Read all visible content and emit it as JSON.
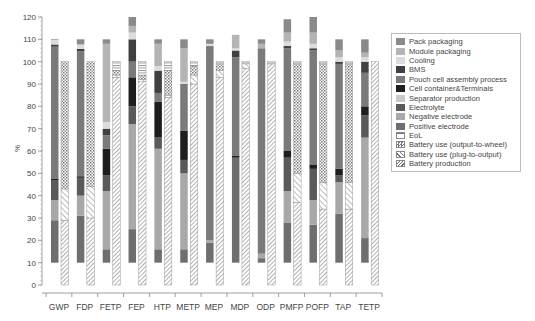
{
  "chart_data": {
    "type": "bar",
    "subtype": "stacked, two bars per category (component contribution bar + life-cycle stage bar)",
    "title": "",
    "xlabel": "",
    "ylabel": "%",
    "ylim": [
      0,
      120
    ],
    "yticks": [
      0,
      10,
      20,
      30,
      40,
      50,
      60,
      70,
      80,
      90,
      100,
      110,
      120
    ],
    "grid": false,
    "legend_position": "right",
    "categories": [
      "GWP",
      "FDP",
      "FETP",
      "FEP",
      "HTP",
      "METP",
      "MEP",
      "MDP",
      "ODP",
      "PMFP",
      "POFP",
      "TAP",
      "TETP"
    ],
    "component_bar_base": 10,
    "component_series": [
      {
        "name": "Positive electrode",
        "color": "#6e6e6e",
        "values": [
          19,
          21,
          6,
          15,
          6,
          6,
          9,
          47,
          2,
          18,
          17,
          22,
          11
        ]
      },
      {
        "name": "Negative electrode",
        "color": "#a8a8a8",
        "values": [
          9,
          9,
          26,
          47,
          45,
          34,
          1,
          0,
          2,
          14,
          11,
          14,
          45
        ]
      },
      {
        "name": "Electrolyte",
        "color": "#5a5a5a",
        "values": [
          9,
          8,
          7,
          8,
          5,
          6,
          0,
          0,
          0,
          15,
          14,
          3,
          10
        ]
      },
      {
        "name": "Separator production",
        "color": "#c8c8c8",
        "values": [
          0,
          0,
          0,
          0,
          0,
          0,
          0,
          0,
          0,
          0,
          0,
          0,
          0
        ]
      },
      {
        "name": "Cell container&Terminals",
        "color": "#1e1e1e",
        "values": [
          0.7,
          0.7,
          12,
          13,
          16,
          13,
          0,
          1,
          0,
          3,
          2,
          3,
          4
        ]
      },
      {
        "name": "Pouch cell assembly process",
        "color": "#7a7a7a",
        "values": [
          59,
          56,
          6,
          7,
          4,
          21,
          87,
          44,
          92,
          46,
          51,
          47,
          15
        ]
      },
      {
        "name": "BMS",
        "color": "#404040",
        "values": [
          1,
          1,
          3,
          10,
          10,
          0,
          0,
          3,
          0,
          1,
          1,
          1,
          5
        ]
      },
      {
        "name": "Cooling",
        "color": "#dcdcdc",
        "values": [
          2,
          2,
          3,
          3,
          2,
          1,
          1,
          1,
          0,
          2,
          2,
          2,
          2
        ]
      },
      {
        "name": "Module packaging",
        "color": "#b4b4b4",
        "values": [
          0,
          0,
          35,
          3,
          10,
          15,
          0,
          6,
          2,
          4,
          5,
          3,
          2
        ]
      },
      {
        "name": "Pack packaging",
        "color": "#8a8a8a",
        "values": [
          0.3,
          2.3,
          2,
          4,
          2,
          4,
          2,
          0,
          2,
          6,
          7,
          5,
          6
        ]
      }
    ],
    "stage_series": [
      {
        "name": "Battery production",
        "pattern": "diagonal-dense",
        "values": [
          29,
          30,
          93,
          91,
          84,
          90,
          93,
          97,
          99,
          37,
          34,
          34,
          100
        ]
      },
      {
        "name": "Battery use (plug-to-output)",
        "pattern": "diagonal-sparse",
        "values": [
          14,
          14,
          1,
          1,
          1,
          4,
          3,
          2,
          0,
          13,
          12,
          12,
          0
        ]
      },
      {
        "name": "Battery use (output-to-wheel)",
        "pattern": "crosshatch",
        "values": [
          57,
          56,
          2,
          2,
          11,
          4,
          3,
          0,
          0,
          49,
          53,
          53,
          0
        ]
      },
      {
        "name": "EoL",
        "pattern": "horizontal",
        "values": [
          0,
          0,
          4,
          6,
          4,
          2,
          1,
          1,
          1,
          1,
          1,
          1,
          0
        ]
      }
    ]
  },
  "legend": {
    "items": [
      {
        "label": "Pack packaging",
        "swatch": "#8a8a8a",
        "pattern": "solid"
      },
      {
        "label": "Module packaging",
        "swatch": "#b4b4b4",
        "pattern": "solid"
      },
      {
        "label": "Cooling",
        "swatch": "#dcdcdc",
        "pattern": "solid"
      },
      {
        "label": "BMS",
        "swatch": "#404040",
        "pattern": "solid"
      },
      {
        "label": "Pouch cell assembly process",
        "swatch": "#7a7a7a",
        "pattern": "solid"
      },
      {
        "label": "Cell container&Terminals",
        "swatch": "#1e1e1e",
        "pattern": "solid"
      },
      {
        "label": "Separator production",
        "swatch": "#c8c8c8",
        "pattern": "solid"
      },
      {
        "label": "Electrolyte",
        "swatch": "#5a5a5a",
        "pattern": "solid"
      },
      {
        "label": "Negative electrode",
        "swatch": "#a8a8a8",
        "pattern": "solid"
      },
      {
        "label": "Positive electrode",
        "swatch": "#6e6e6e",
        "pattern": "solid"
      },
      {
        "label": "EoL",
        "swatch": "#ffffff",
        "pattern": "horizontal"
      },
      {
        "label": "Battery use (output-to-wheel)",
        "swatch": "#ffffff",
        "pattern": "crosshatch"
      },
      {
        "label": "Battery use (plug-to-output)",
        "swatch": "#ffffff",
        "pattern": "diagonal-sparse"
      },
      {
        "label": "Battery production",
        "swatch": "#ffffff",
        "pattern": "diagonal-dense"
      }
    ]
  },
  "axis": {
    "ylabel": "%"
  }
}
